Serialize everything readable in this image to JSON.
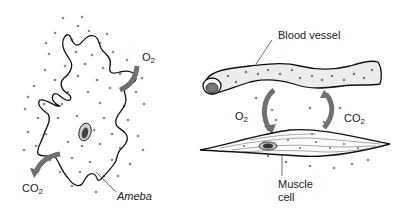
{
  "diagram": {
    "panels": [
      {
        "name": "ameba-panel",
        "labels": {
          "o2": {
            "base": "O",
            "sub": "2"
          },
          "co2": {
            "base": "CO",
            "sub": "2"
          },
          "organism": "Ameba"
        }
      },
      {
        "name": "muscle-panel",
        "labels": {
          "blood_vessel": "Blood vessel",
          "o2": {
            "base": "O",
            "sub": "2"
          },
          "co2": {
            "base": "CO",
            "sub": "2"
          },
          "muscle_line1": "Muscle",
          "muscle_line2": "cell"
        }
      }
    ],
    "colors": {
      "outline": "#111111",
      "arrow": "#707070",
      "dot": "#8a8a8a",
      "background": "#ffffff"
    }
  }
}
